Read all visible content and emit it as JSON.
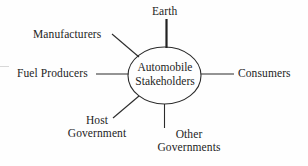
{
  "diagram": {
    "type": "hub-and-spoke stakeholder diagram",
    "hub": {
      "shape": "ellipse",
      "line1": "Automobile",
      "line2": "Stakeholders",
      "full_label": "Automobile Stakeholders"
    },
    "stroke_color": "#2b2b2b",
    "background_color": "#fefefe",
    "text_color": "#1d1d1d",
    "spokes": [
      {
        "id": "earth",
        "label": "Earth",
        "line1": "Earth",
        "line2": "",
        "position": "top",
        "connector": "vertical",
        "emphasis": "thick"
      },
      {
        "id": "manufacturers",
        "label": "Manufacturers",
        "line1": "Manufacturers",
        "line2": "",
        "position": "upper-left",
        "connector": "diagonal",
        "emphasis": "normal"
      },
      {
        "id": "fuel-producers",
        "label": "Fuel Producers",
        "line1": "Fuel Producers",
        "line2": "",
        "position": "left",
        "connector": "horizontal",
        "emphasis": "normal"
      },
      {
        "id": "consumers",
        "label": "Consumers",
        "line1": "Consumers",
        "line2": "",
        "position": "right",
        "connector": "horizontal",
        "emphasis": "normal"
      },
      {
        "id": "host-government",
        "label": "Host Government",
        "line1": "Host",
        "line2": "Government",
        "position": "lower-left",
        "connector": "diagonal",
        "emphasis": "normal"
      },
      {
        "id": "other-governments",
        "label": "Other Governments",
        "line1": "Other",
        "line2": "Governments",
        "position": "bottom",
        "connector": "vertical",
        "emphasis": "normal"
      }
    ]
  }
}
